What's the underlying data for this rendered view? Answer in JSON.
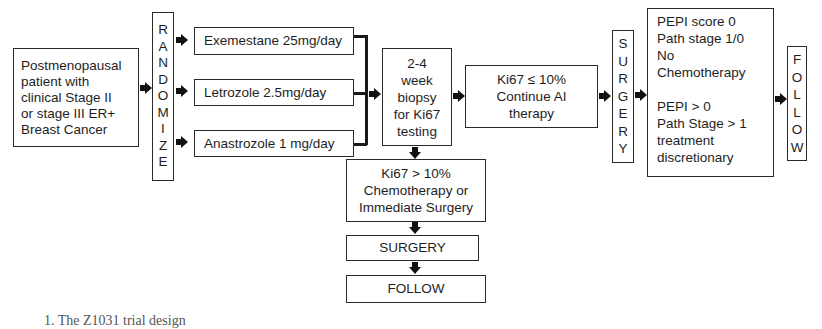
{
  "diagram": {
    "type": "flowchart",
    "nodes": {
      "patient": "Postmenopausal\npatient with\nclinical Stage II\nor stage III ER+\nBreast Cancer",
      "randomize": [
        "R",
        "A",
        "N",
        "D",
        "O",
        "M",
        "I",
        "Z",
        "E"
      ],
      "arms": [
        "Exemestane 25mg/day",
        "Letrozole 2.5mg/day",
        "Anastrozole 1 mg/day"
      ],
      "biopsy": "2-4\nweek\nbiopsy\nfor Ki67\ntesting",
      "continue_ai": "Ki67 ≤ 10%\nContinue AI\ntherapy",
      "surgery_vertical": [
        "S",
        "U",
        "R",
        "G",
        "E",
        "R",
        "Y"
      ],
      "pepi": "PEPI score 0\nPath stage 1/0\nNo\nChemotherapy\n\nPEPI > 0\nPath Stage > 1\ntreatment\ndiscretionary",
      "follow_vertical": [
        "F",
        "O",
        "L",
        "L",
        "O",
        "W"
      ],
      "high_ki67": "Ki67 > 10%\nChemotherapy or\nImmediate Surgery",
      "surgery_bottom": "SURGERY",
      "follow_bottom": "FOLLOW"
    },
    "edges": [
      [
        "patient",
        "randomize"
      ],
      [
        "randomize",
        "arms.0"
      ],
      [
        "randomize",
        "arms.1"
      ],
      [
        "randomize",
        "arms.2"
      ],
      [
        "arms",
        "biopsy"
      ],
      [
        "biopsy",
        "continue_ai"
      ],
      [
        "continue_ai",
        "surgery_vertical"
      ],
      [
        "surgery_vertical",
        "pepi"
      ],
      [
        "pepi",
        "follow_vertical"
      ],
      [
        "biopsy",
        "high_ki67"
      ],
      [
        "high_ki67",
        "surgery_bottom"
      ],
      [
        "surgery_bottom",
        "follow_bottom"
      ]
    ],
    "caption": "1. The Z1031 trial design"
  }
}
